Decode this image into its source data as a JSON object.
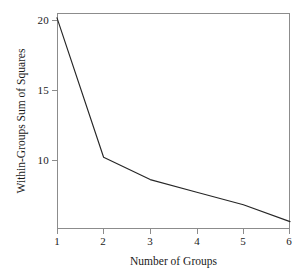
{
  "chart_data": {
    "type": "line",
    "title": "",
    "xlabel": "Number of Groups",
    "ylabel": "Within-Groups Sum of Squares",
    "x": [
      1,
      2,
      3,
      4,
      5,
      6
    ],
    "values": [
      20.15,
      10.2,
      8.6,
      7.7,
      6.8,
      5.6
    ],
    "series": [
      {
        "name": "Within-Groups Sum of Squares",
        "values": [
          20.15,
          10.2,
          8.6,
          7.7,
          6.8,
          5.6
        ]
      }
    ],
    "xlim": [
      1,
      6
    ],
    "ylim": [
      5.0,
      20.5
    ],
    "xticks": [
      "1",
      "2",
      "3",
      "4",
      "5",
      "6"
    ],
    "yticks": [
      "10",
      "15",
      "20"
    ],
    "ytick_values": [
      10,
      15,
      20
    ],
    "grid": false,
    "legend": false,
    "line_color": "#262626",
    "frame_color": "#8c8c8c",
    "background_color": "#ffffff"
  }
}
